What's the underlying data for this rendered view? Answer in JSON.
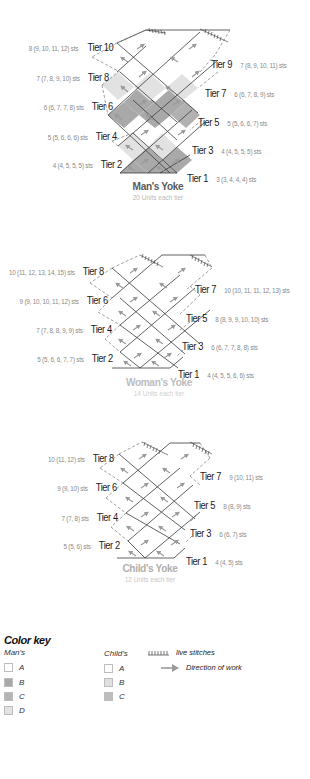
{
  "colors": {
    "A": "#ffffff",
    "B_man": "#a9a9a9",
    "C_man": "#b5b5b5",
    "D_man": "#e2e2e2",
    "B_child": "#e0e0e0",
    "C_child": "#bdbdbd",
    "line": "#3a3a3a",
    "dash": "#777777",
    "arrow": "#9a9a9a"
  },
  "mans_yoke": {
    "title": "Man's Yoke",
    "units": "20 Units each tier",
    "left_tiers": [
      {
        "tier": "Tier 10",
        "sts": "8 (9, 10, 11, 12) sts"
      },
      {
        "tier": "Tier 8",
        "sts": "7 (7, 8, 9, 10) sts"
      },
      {
        "tier": "Tier 6",
        "sts": "6 (6, 7, 7, 8) sts"
      },
      {
        "tier": "Tier 4",
        "sts": "5 (5, 6, 6, 6) sts"
      },
      {
        "tier": "Tier 2",
        "sts": "4 (4, 5, 5, 5) sts"
      }
    ],
    "right_tiers": [
      {
        "tier": "Tier 9",
        "sts": "7 (8, 9, 10, 11) sts"
      },
      {
        "tier": "Tier 7",
        "sts": "6 (6, 7, 8, 9) sts"
      },
      {
        "tier": "Tier 5",
        "sts": "5 (5, 6, 6, 7) sts"
      },
      {
        "tier": "Tier 3",
        "sts": "4 (4, 5, 5, 5) sts"
      },
      {
        "tier": "Tier 1",
        "sts": "3 (3, 4, 4, 4) sts"
      }
    ]
  },
  "womans_yoke": {
    "title": "Woman's Yoke",
    "units": "14 Units each tier",
    "left_tiers": [
      {
        "tier": "Tier 8",
        "sts": "10 (11, 12, 13, 14, 15) sts"
      },
      {
        "tier": "Tier 6",
        "sts": "9 (9, 10, 10, 11, 12) sts"
      },
      {
        "tier": "Tier 4",
        "sts": "7 (7, 8, 8, 9, 9) sts"
      },
      {
        "tier": "Tier 2",
        "sts": "5 (5, 6, 6, 7, 7) sts"
      }
    ],
    "right_tiers": [
      {
        "tier": "Tier 7",
        "sts": "10 (10, 11, 11, 12, 13) sts"
      },
      {
        "tier": "Tier 5",
        "sts": "8 (8, 9, 9, 10, 10) sts"
      },
      {
        "tier": "Tier 3",
        "sts": "6 (6, 7, 7, 8, 8) sts"
      },
      {
        "tier": "Tier 1",
        "sts": "4 (4, 5, 5, 6, 6) sts"
      }
    ]
  },
  "childs_yoke": {
    "title": "Child's Yoke",
    "units": "12 Units each tier",
    "left_tiers": [
      {
        "tier": "Tier 8",
        "sts": "10 (11, 12) sts"
      },
      {
        "tier": "Tier 6",
        "sts": "9 (9, 10) sts"
      },
      {
        "tier": "Tier 4",
        "sts": "7 (7, 8) sts"
      },
      {
        "tier": "Tier 2",
        "sts": "5 (5, 6) sts"
      }
    ],
    "right_tiers": [
      {
        "tier": "Tier 7",
        "sts": "9 (10, 11) sts"
      },
      {
        "tier": "Tier 5",
        "sts": "8 (8, 9) sts"
      },
      {
        "tier": "Tier 3",
        "sts": "6 (6, 7) sts"
      },
      {
        "tier": "Tier 1",
        "sts": "4 (4, 5) sts"
      }
    ]
  },
  "color_key": {
    "heading": "Color key",
    "mans": {
      "title": "Man's",
      "items": [
        "A",
        "B",
        "C",
        "D"
      ]
    },
    "childs": {
      "title": "Child's",
      "items": [
        "A",
        "B",
        "C"
      ]
    },
    "legend": {
      "live_stitches": "live stitches",
      "direction": "Direction of work",
      "live_stitches_icon": "tick-marks-icon",
      "direction_icon": "arrow-right-icon"
    }
  }
}
